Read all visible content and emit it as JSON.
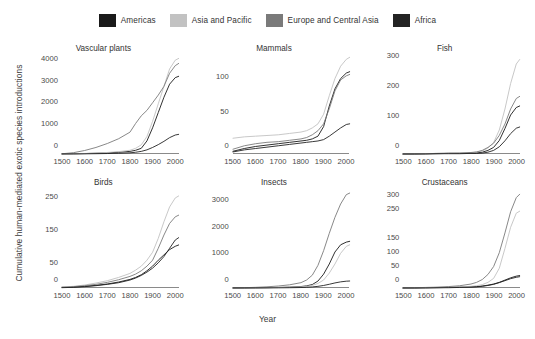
{
  "legend": {
    "items": [
      {
        "label": "Americas",
        "color": "#1a1a1a"
      },
      {
        "label": "Asia and Pacific",
        "color": "#c2c2c2"
      },
      {
        "label": "Europe and Central Asia",
        "color": "#7a7a7a"
      },
      {
        "label": "Africa",
        "color": "#232323"
      }
    ]
  },
  "axes": {
    "xlabel": "Year",
    "ylabel": "Cumulative human-mediated exotic species introductions"
  },
  "chart_data": [
    {
      "type": "line",
      "title": "Vascular plants",
      "xlabel": "Year",
      "ylabel": "Cumulative human-mediated exotic species introductions",
      "xlim": [
        1500,
        2015
      ],
      "ylim": [
        0,
        4400
      ],
      "xticks": [
        1500,
        1600,
        1700,
        1800,
        1900,
        2000
      ],
      "xticklabels": [
        "1500",
        "1600",
        "1700",
        "1800",
        "1900",
        "2000"
      ],
      "yticks": [
        0,
        1000,
        2000,
        3000,
        4000
      ],
      "yticklabels": [
        "0",
        "1000",
        "2000",
        "3000",
        "4000"
      ],
      "grid": false,
      "x": [
        1500,
        1550,
        1600,
        1650,
        1700,
        1750,
        1800,
        1825,
        1850,
        1875,
        1900,
        1925,
        1950,
        1975,
        2000,
        2015
      ],
      "series": [
        {
          "name": "Americas",
          "color": "#1a1a1a",
          "values": [
            5,
            10,
            20,
            35,
            55,
            80,
            120,
            170,
            260,
            600,
            1200,
            1900,
            2600,
            3200,
            3500,
            3560
          ]
        },
        {
          "name": "Asia and Pacific",
          "color": "#c2c2c2",
          "values": [
            5,
            12,
            25,
            45,
            70,
            110,
            170,
            260,
            420,
            800,
            1500,
            2300,
            3100,
            3900,
            4300,
            4380
          ]
        },
        {
          "name": "Europe and Central Asia",
          "color": "#7a7a7a",
          "values": [
            10,
            60,
            160,
            300,
            480,
            700,
            1000,
            1400,
            1750,
            2000,
            2350,
            2700,
            3100,
            3700,
            4050,
            4150
          ]
        },
        {
          "name": "Africa",
          "color": "#232323",
          "values": [
            2,
            4,
            8,
            14,
            22,
            35,
            55,
            80,
            120,
            190,
            300,
            430,
            580,
            750,
            870,
            900
          ]
        }
      ]
    },
    {
      "type": "line",
      "title": "Mammals",
      "xlabel": "Year",
      "ylabel": "",
      "xlim": [
        1500,
        2015
      ],
      "ylim": [
        0,
        140
      ],
      "xticks": [
        1500,
        1600,
        1700,
        1800,
        1900,
        2000
      ],
      "xticklabels": [
        "1500",
        "1600",
        "1700",
        "1800",
        "1900",
        "2000"
      ],
      "yticks": [
        0,
        50,
        100
      ],
      "yticklabels": [
        "0",
        "50",
        "100"
      ],
      "grid": false,
      "x": [
        1500,
        1550,
        1600,
        1650,
        1700,
        1750,
        1800,
        1825,
        1850,
        1875,
        1900,
        1925,
        1950,
        1975,
        2000,
        2015
      ],
      "series": [
        {
          "name": "Americas",
          "color": "#1a1a1a",
          "values": [
            4,
            8,
            11,
            13,
            15,
            17,
            19,
            20,
            22,
            26,
            40,
            70,
            95,
            110,
            118,
            120
          ]
        },
        {
          "name": "Asia and Pacific",
          "color": "#c2c2c2",
          "values": [
            23,
            25,
            26,
            27,
            28,
            30,
            32,
            34,
            38,
            44,
            58,
            85,
            110,
            128,
            138,
            141
          ]
        },
        {
          "name": "Europe and Central Asia",
          "color": "#7a7a7a",
          "values": [
            7,
            12,
            15,
            17,
            18,
            20,
            22,
            24,
            28,
            34,
            44,
            66,
            92,
            108,
            114,
            116
          ]
        },
        {
          "name": "Africa",
          "color": "#232323",
          "values": [
            3,
            6,
            8,
            10,
            12,
            14,
            16,
            17,
            18,
            19,
            21,
            26,
            32,
            38,
            43,
            44
          ]
        }
      ]
    },
    {
      "type": "line",
      "title": "Fish",
      "xlabel": "Year",
      "ylabel": "",
      "xlim": [
        1500,
        2015
      ],
      "ylim": [
        0,
        320
      ],
      "xticks": [
        1500,
        1600,
        1700,
        1800,
        1900,
        2000
      ],
      "xticklabels": [
        "1500",
        "1600",
        "1700",
        "1800",
        "1900",
        "2000"
      ],
      "yticks": [
        0,
        100,
        200,
        300
      ],
      "yticklabels": [
        "0",
        "100",
        "200",
        "300"
      ],
      "grid": false,
      "x": [
        1500,
        1550,
        1600,
        1650,
        1700,
        1750,
        1800,
        1825,
        1850,
        1875,
        1900,
        1925,
        1950,
        1975,
        2000,
        2015
      ],
      "series": [
        {
          "name": "Americas",
          "color": "#1a1a1a",
          "values": [
            0,
            0,
            1,
            1,
            2,
            2,
            3,
            4,
            6,
            12,
            22,
            45,
            85,
            130,
            155,
            160
          ]
        },
        {
          "name": "Asia and Pacific",
          "color": "#c2c2c2",
          "values": [
            0,
            1,
            1,
            2,
            2,
            3,
            4,
            6,
            10,
            20,
            38,
            80,
            150,
            235,
            300,
            315
          ]
        },
        {
          "name": "Europe and Central Asia",
          "color": "#7a7a7a",
          "values": [
            0,
            1,
            1,
            2,
            3,
            3,
            5,
            7,
            12,
            22,
            36,
            62,
            100,
            150,
            185,
            192
          ]
        },
        {
          "name": "Africa",
          "color": "#232323",
          "values": [
            0,
            0,
            0,
            1,
            1,
            1,
            2,
            2,
            3,
            6,
            12,
            24,
            44,
            68,
            86,
            90
          ]
        }
      ]
    },
    {
      "type": "line",
      "title": "Birds",
      "xlabel": "Year",
      "ylabel": "Cumulative human-mediated exotic species introductions",
      "xlim": [
        1500,
        2015
      ],
      "ylim": [
        0,
        290
      ],
      "xticks": [
        1500,
        1600,
        1700,
        1800,
        1900,
        2000
      ],
      "xticklabels": [
        "1500",
        "1600",
        "1700",
        "1800",
        "1900",
        "2000"
      ],
      "yticks": [
        0,
        50,
        150,
        250
      ],
      "yticklabels": [
        "0",
        "50",
        "150",
        "250"
      ],
      "grid": false,
      "x": [
        1500,
        1550,
        1600,
        1650,
        1700,
        1750,
        1800,
        1825,
        1850,
        1875,
        1900,
        1925,
        1950,
        1975,
        2000,
        2015
      ],
      "series": [
        {
          "name": "Americas",
          "color": "#1a1a1a",
          "values": [
            2,
            3,
            5,
            8,
            12,
            18,
            26,
            32,
            40,
            52,
            66,
            84,
            100,
            116,
            126,
            130
          ]
        },
        {
          "name": "Asia and Pacific",
          "color": "#c2c2c2",
          "values": [
            3,
            5,
            9,
            15,
            22,
            32,
            44,
            54,
            66,
            84,
            108,
            150,
            200,
            245,
            272,
            278
          ]
        },
        {
          "name": "Europe and Central Asia",
          "color": "#7a7a7a",
          "values": [
            2,
            4,
            7,
            11,
            17,
            25,
            35,
            42,
            52,
            66,
            84,
            120,
            160,
            195,
            215,
            220
          ]
        },
        {
          "name": "Africa",
          "color": "#232323",
          "values": [
            1,
            2,
            4,
            7,
            11,
            16,
            24,
            30,
            38,
            48,
            60,
            76,
            95,
            120,
            145,
            152
          ]
        }
      ]
    },
    {
      "type": "line",
      "title": "Insects",
      "xlabel": "Year",
      "ylabel": "",
      "xlim": [
        1500,
        2015
      ],
      "ylim": [
        0,
        3600
      ],
      "xticks": [
        1500,
        1600,
        1700,
        1800,
        1900,
        2000
      ],
      "xticklabels": [
        "1500",
        "1600",
        "1700",
        "1800",
        "1900",
        "2000"
      ],
      "yticks": [
        0,
        1000,
        2000,
        3000
      ],
      "yticklabels": [
        "0",
        "1000",
        "2000",
        "3000"
      ],
      "grid": false,
      "x": [
        1500,
        1550,
        1600,
        1650,
        1700,
        1750,
        1800,
        1825,
        1850,
        1875,
        1900,
        1925,
        1950,
        1975,
        2000,
        2015
      ],
      "series": [
        {
          "name": "Americas",
          "color": "#1a1a1a",
          "values": [
            2,
            4,
            8,
            14,
            22,
            34,
            55,
            80,
            130,
            260,
            520,
            900,
            1350,
            1620,
            1720,
            1750
          ]
        },
        {
          "name": "Asia and Pacific",
          "color": "#c2c2c2",
          "values": [
            1,
            3,
            6,
            10,
            16,
            26,
            42,
            60,
            95,
            170,
            300,
            560,
            900,
            1300,
            1560,
            1620
          ]
        },
        {
          "name": "Europe and Central Asia",
          "color": "#7a7a7a",
          "values": [
            5,
            12,
            25,
            45,
            75,
            120,
            200,
            300,
            480,
            850,
            1400,
            2050,
            2650,
            3150,
            3500,
            3560
          ]
        },
        {
          "name": "Africa",
          "color": "#232323",
          "values": [
            1,
            1,
            2,
            4,
            7,
            11,
            18,
            26,
            40,
            62,
            95,
            140,
            190,
            230,
            255,
            262
          ]
        }
      ]
    },
    {
      "type": "line",
      "title": "Crustaceans",
      "xlabel": "Year",
      "ylabel": "",
      "xlim": [
        1500,
        2015
      ],
      "ylim": [
        0,
        340
      ],
      "xticks": [
        1500,
        1600,
        1700,
        1800,
        1900,
        2000
      ],
      "xticklabels": [
        "1500",
        "1600",
        "1700",
        "1800",
        "1900",
        "2000"
      ],
      "yticks": [
        0,
        50,
        100,
        150,
        250,
        300
      ],
      "yticklabels": [
        "0",
        "50",
        "100",
        "150",
        "250",
        "300"
      ],
      "grid": false,
      "x": [
        1500,
        1550,
        1600,
        1650,
        1700,
        1750,
        1800,
        1825,
        1850,
        1875,
        1900,
        1925,
        1950,
        1975,
        2000,
        2015
      ],
      "series": [
        {
          "name": "Americas",
          "color": "#1a1a1a",
          "values": [
            0,
            0,
            1,
            1,
            2,
            3,
            4,
            5,
            7,
            10,
            14,
            20,
            28,
            36,
            42,
            44
          ]
        },
        {
          "name": "Asia and Pacific",
          "color": "#c2c2c2",
          "values": [
            0,
            1,
            1,
            2,
            3,
            4,
            6,
            8,
            12,
            20,
            34,
            70,
            140,
            215,
            265,
            272
          ]
        },
        {
          "name": "Europe and Central Asia",
          "color": "#7a7a7a",
          "values": [
            0,
            1,
            2,
            3,
            5,
            8,
            14,
            20,
            30,
            48,
            76,
            125,
            195,
            270,
            320,
            332
          ]
        },
        {
          "name": "Africa",
          "color": "#232323",
          "values": [
            0,
            0,
            0,
            1,
            1,
            2,
            3,
            4,
            6,
            9,
            13,
            19,
            26,
            33,
            38,
            40
          ]
        }
      ]
    }
  ]
}
